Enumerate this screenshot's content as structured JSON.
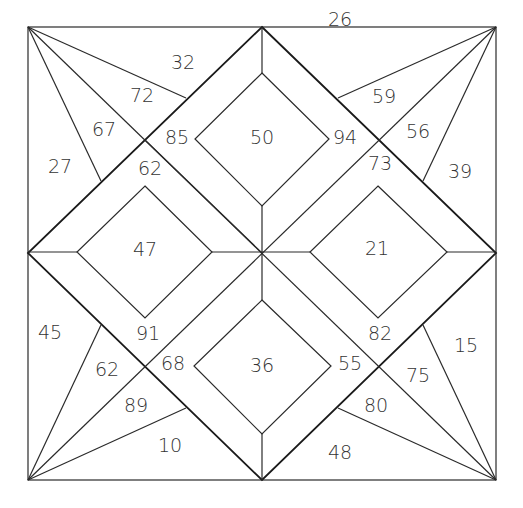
{
  "diagram": {
    "line_color": "#2a2a2a",
    "background": "#ffffff",
    "regions": {
      "top_outer": "26",
      "top_left_outer": "32",
      "top_left_fan_1": "72",
      "top_left_fan_2": "67",
      "left_top_outer": "27",
      "band_top_left_upper": "85",
      "band_top_left_lower": "62",
      "top_diamond": "50",
      "band_top_right_upper": "94",
      "band_top_right_lower": "73",
      "top_right_fan_1": "59",
      "top_right_fan_2": "56",
      "right_top_outer": "39",
      "left_diamond": "47",
      "right_diamond": "21",
      "left_bottom_outer": "45",
      "bottom_left_fan_1": "62",
      "bottom_left_fan_2": "89",
      "bottom_left_outer": "10",
      "band_bottom_left_upper": "91",
      "band_bottom_left_lower": "68",
      "bottom_diamond": "36",
      "band_bottom_right_upper": "82",
      "band_bottom_right_lower": "55",
      "bottom_right_fan_1": "75",
      "bottom_right_fan_2": "80",
      "right_bottom_outer": "15",
      "bottom_outer": "48"
    }
  }
}
